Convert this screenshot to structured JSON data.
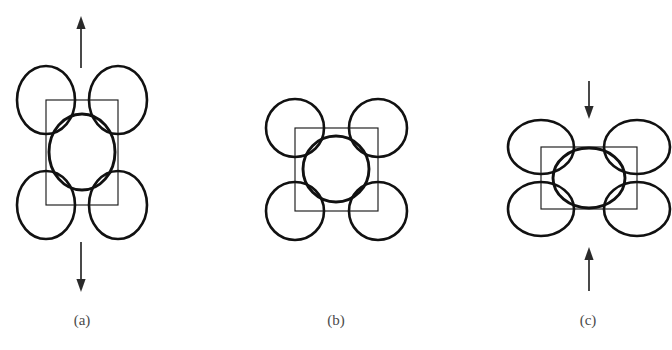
{
  "figure": {
    "width": 672,
    "height": 350,
    "background": "#ffffff",
    "stroke_color": "#111111",
    "cell_stroke_color": "#1a1a1a",
    "arrow_color": "#2a2a2a",
    "caption_color": "#4a4a4a"
  },
  "chart_data": {
    "type": "diagram",
    "title": "",
    "panels": [
      {
        "id": "a",
        "caption": "(a)",
        "state": "tension",
        "caption_x": 82,
        "caption_y": 312,
        "cell": {
          "x": 46,
          "y": 100,
          "width": 72,
          "height": 105
        },
        "center_atom": {
          "cx": 82,
          "cy": 152,
          "rx": 33,
          "ry": 38
        },
        "corner_atoms": [
          {
            "cx": 46,
            "cy": 100,
            "rx": 29,
            "ry": 34
          },
          {
            "cx": 118,
            "cy": 100,
            "rx": 29,
            "ry": 34
          },
          {
            "cx": 46,
            "cy": 205,
            "rx": 29,
            "ry": 34
          },
          {
            "cx": 118,
            "cy": 205,
            "rx": 29,
            "ry": 34
          }
        ],
        "arrows": [
          {
            "name": "tension-arrow-up",
            "x": 81,
            "y_tail": 68,
            "y_head": 16,
            "direction": "up"
          },
          {
            "name": "tension-arrow-down",
            "x": 81,
            "y_tail": 242,
            "y_head": 292,
            "direction": "down"
          }
        ]
      },
      {
        "id": "b",
        "caption": "(b)",
        "state": "unstrained",
        "caption_x": 336,
        "caption_y": 312,
        "cell": {
          "x": 295,
          "y": 128,
          "width": 83,
          "height": 83
        },
        "center_atom": {
          "cx": 336,
          "cy": 169,
          "rx": 33,
          "ry": 33
        },
        "corner_atoms": [
          {
            "cx": 295,
            "cy": 128,
            "rx": 29,
            "ry": 29
          },
          {
            "cx": 378,
            "cy": 128,
            "rx": 29,
            "ry": 29
          },
          {
            "cx": 295,
            "cy": 211,
            "rx": 29,
            "ry": 29
          },
          {
            "cx": 378,
            "cy": 211,
            "rx": 29,
            "ry": 29
          }
        ],
        "arrows": []
      },
      {
        "id": "c",
        "caption": "(c)",
        "state": "compression",
        "caption_x": 588,
        "caption_y": 312,
        "cell": {
          "x": 541,
          "y": 147,
          "width": 96,
          "height": 62
        },
        "center_atom": {
          "cx": 589,
          "cy": 178,
          "rx": 36,
          "ry": 30
        },
        "corner_atoms": [
          {
            "cx": 541,
            "cy": 147,
            "rx": 33,
            "ry": 27
          },
          {
            "cx": 637,
            "cy": 147,
            "rx": 33,
            "ry": 27
          },
          {
            "cx": 541,
            "cy": 209,
            "rx": 33,
            "ry": 27
          },
          {
            "cx": 637,
            "cy": 209,
            "rx": 33,
            "ry": 27
          }
        ],
        "arrows": [
          {
            "name": "compression-arrow-down",
            "x": 589,
            "y_tail": 81,
            "y_head": 119,
            "direction": "down"
          },
          {
            "name": "compression-arrow-up",
            "x": 589,
            "y_tail": 291,
            "y_head": 247,
            "direction": "up"
          }
        ]
      }
    ]
  }
}
